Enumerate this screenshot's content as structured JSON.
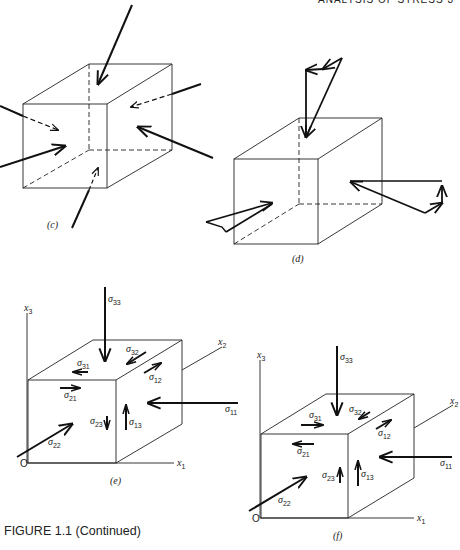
{
  "page": {
    "running_header": "ANALYSIS OF STRESS   3",
    "caption": "FIGURE 1.1 (Continued)"
  },
  "panels": {
    "c": {
      "label": "(c)"
    },
    "d": {
      "label": "(d)"
    },
    "e": {
      "label": "(e)",
      "axes": {
        "x1": "x",
        "x1_sub": "1",
        "x2": "x",
        "x2_sub": "2",
        "x3": "x",
        "x3_sub": "3",
        "origin": "O"
      },
      "stresses": {
        "s33": {
          "sym": "σ",
          "sub": "33"
        },
        "s31": {
          "sym": "σ",
          "sub": "31"
        },
        "s32": {
          "sym": "σ",
          "sub": "32"
        },
        "s12": {
          "sym": "σ",
          "sub": "12"
        },
        "s21": {
          "sym": "σ",
          "sub": "21"
        },
        "s11": {
          "sym": "σ",
          "sub": "11"
        },
        "s23": {
          "sym": "σ",
          "sub": "23"
        },
        "s13": {
          "sym": "σ",
          "sub": "13"
        },
        "s22": {
          "sym": "σ",
          "sub": "22"
        }
      }
    },
    "f": {
      "label": "(f)",
      "axes": {
        "x1": "x",
        "x1_sub": "1",
        "x2": "x",
        "x2_sub": "2",
        "x3": "x",
        "x3_sub": "3",
        "origin": "O"
      },
      "stresses": {
        "s33": {
          "sym": "σ",
          "sub": "33"
        },
        "s31": {
          "sym": "σ",
          "sub": "31"
        },
        "s32": {
          "sym": "σ",
          "sub": "32"
        },
        "s12": {
          "sym": "σ",
          "sub": "12"
        },
        "s21": {
          "sym": "σ",
          "sub": "21"
        },
        "s11": {
          "sym": "σ",
          "sub": "11"
        },
        "s23": {
          "sym": "σ",
          "sub": "23"
        },
        "s13": {
          "sym": "σ",
          "sub": "13"
        },
        "s22": {
          "sym": "σ",
          "sub": "22"
        }
      }
    }
  }
}
